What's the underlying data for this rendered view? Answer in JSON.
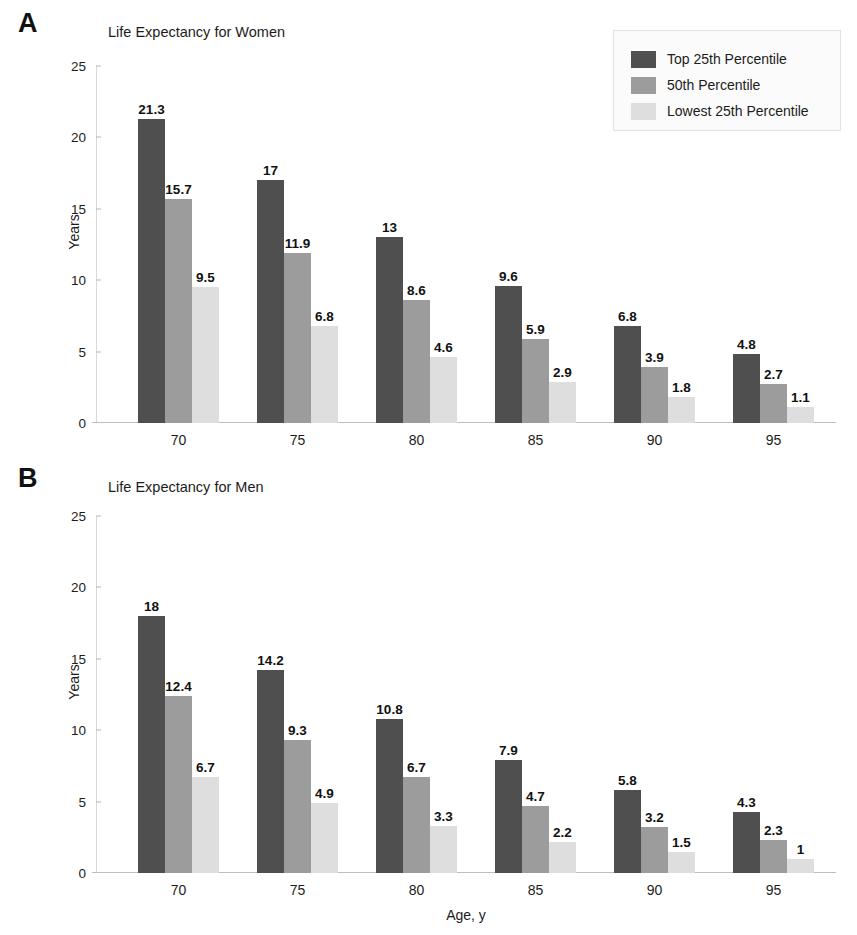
{
  "figure": {
    "panels": [
      {
        "letter": "A",
        "title": "Life Expectancy for Women"
      },
      {
        "letter": "B",
        "title": "Life Expectancy for Men"
      }
    ],
    "legend": {
      "items": [
        {
          "label": "Top 25th Percentile",
          "color": "#4f4f4f"
        },
        {
          "label": "50th Percentile",
          "color": "#9c9c9c"
        },
        {
          "label": "Lowest 25th Percentile",
          "color": "#dedede"
        }
      ]
    },
    "y_axis_title": "Years",
    "x_axis_title": "Age, y",
    "y_ticks": [
      "0",
      "5",
      "10",
      "15",
      "20",
      "25"
    ]
  },
  "chart_data": [
    {
      "type": "bar",
      "title": "Life Expectancy for Women",
      "panel": "A",
      "xlabel": "",
      "ylabel": "Years",
      "ylim": [
        0,
        25
      ],
      "yticks": [
        0,
        5,
        10,
        15,
        20,
        25
      ],
      "grid": false,
      "legend_position": "top-right (shared)",
      "categories": [
        "70",
        "75",
        "80",
        "85",
        "90",
        "95"
      ],
      "series": [
        {
          "name": "Top 25th Percentile",
          "color": "#4f4f4f",
          "values": [
            21.3,
            17,
            13,
            9.6,
            6.8,
            4.8
          ],
          "labels": [
            "21.3",
            "17",
            "13",
            "9.6",
            "6.8",
            "4.8"
          ]
        },
        {
          "name": "50th Percentile",
          "color": "#9c9c9c",
          "values": [
            15.7,
            11.9,
            8.6,
            5.9,
            3.9,
            2.7
          ],
          "labels": [
            "15.7",
            "11.9",
            "8.6",
            "5.9",
            "3.9",
            "2.7"
          ]
        },
        {
          "name": "Lowest 25th Percentile",
          "color": "#dedede",
          "values": [
            9.5,
            6.8,
            4.6,
            2.9,
            1.8,
            1.1
          ],
          "labels": [
            "9.5",
            "6.8",
            "4.6",
            "2.9",
            "1.8",
            "1.1"
          ]
        }
      ]
    },
    {
      "type": "bar",
      "title": "Life Expectancy for Men",
      "panel": "B",
      "xlabel": "Age, y",
      "ylabel": "Years",
      "ylim": [
        0,
        25
      ],
      "yticks": [
        0,
        5,
        10,
        15,
        20,
        25
      ],
      "grid": false,
      "legend_position": "top-right (shared)",
      "categories": [
        "70",
        "75",
        "80",
        "85",
        "90",
        "95"
      ],
      "series": [
        {
          "name": "Top 25th Percentile",
          "color": "#4f4f4f",
          "values": [
            18,
            14.2,
            10.8,
            7.9,
            5.8,
            4.3
          ],
          "labels": [
            "18",
            "14.2",
            "10.8",
            "7.9",
            "5.8",
            "4.3"
          ]
        },
        {
          "name": "50th Percentile",
          "color": "#9c9c9c",
          "values": [
            12.4,
            9.3,
            6.7,
            4.7,
            3.2,
            2.3
          ],
          "labels": [
            "12.4",
            "9.3",
            "6.7",
            "4.7",
            "3.2",
            "2.3"
          ]
        },
        {
          "name": "Lowest 25th Percentile",
          "color": "#dedede",
          "values": [
            6.7,
            4.9,
            3.3,
            2.2,
            1.5,
            1
          ],
          "labels": [
            "6.7",
            "4.9",
            "3.3",
            "2.2",
            "1.5",
            "1"
          ]
        }
      ]
    }
  ]
}
